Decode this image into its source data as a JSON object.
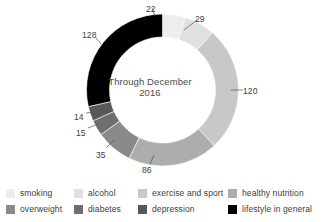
{
  "chart_data": {
    "type": "pie",
    "variant": "donut",
    "title": "",
    "center_text_line1": "Through December",
    "center_text_line2": "2016",
    "categories": [
      "smoking",
      "alcohol",
      "exercise and sport",
      "healthy nutrition",
      "overweight",
      "diabetes",
      "depression",
      "lifestyle in general"
    ],
    "values": [
      22,
      29,
      120,
      86,
      35,
      15,
      14,
      128
    ],
    "total": 449,
    "colors": [
      "#EDEDED",
      "#E0E0E0",
      "#C8C8C8",
      "#ADADAD",
      "#8A8A8A",
      "#6E6E6E",
      "#585858",
      "#000000"
    ],
    "start_angle_deg": 0,
    "direction": "clockwise",
    "legend_position": "bottom",
    "grid": false,
    "data_labels": [
      "22",
      "29",
      "120",
      "86",
      "35",
      "15",
      "14",
      "128"
    ]
  },
  "legend": {
    "rows": [
      [
        {
          "label": "smoking",
          "color": "#EDEDED",
          "left": 6
        },
        {
          "label": "alcohol",
          "color": "#E0E0E0",
          "left": 74
        },
        {
          "label": "exercise and sport",
          "color": "#C8C8C8",
          "left": 138
        },
        {
          "label": "healthy nutrition",
          "color": "#ADADAD",
          "left": 228
        }
      ],
      [
        {
          "label": "overweight",
          "color": "#8A8A8A",
          "left": 6
        },
        {
          "label": "diabetes",
          "color": "#6E6E6E",
          "left": 74
        },
        {
          "label": "depression",
          "color": "#585858",
          "left": 138
        },
        {
          "label": "lifestyle in general",
          "color": "#000000",
          "left": 228
        }
      ]
    ]
  },
  "labels": [
    {
      "text": "22",
      "x": 146,
      "y": 4,
      "anchor": "start"
    },
    {
      "text": "29",
      "x": 195,
      "y": 14,
      "anchor": "start"
    },
    {
      "text": "120",
      "x": 243,
      "y": 86,
      "anchor": "start"
    },
    {
      "text": "86",
      "x": 142,
      "y": 165,
      "anchor": "start"
    },
    {
      "text": "35",
      "x": 96,
      "y": 150,
      "anchor": "start"
    },
    {
      "text": "15",
      "x": 76,
      "y": 128,
      "anchor": "start"
    },
    {
      "text": "14",
      "x": 74,
      "y": 112,
      "anchor": "start"
    },
    {
      "text": "128",
      "x": 82,
      "y": 30,
      "anchor": "start"
    }
  ]
}
